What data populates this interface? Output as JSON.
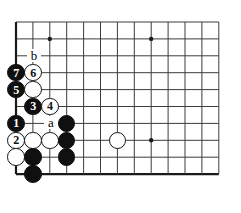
{
  "figure": {
    "name": "go-board-diagram",
    "type": "go-joseki-diagram",
    "corner": "bottom-left",
    "background_color": "#ffffff",
    "line_color": "#3c3c3c",
    "edge_color": "#1a1a1a",
    "black_color": "#101010",
    "white_color": "#ffffff"
  },
  "board": {
    "origin_x": 16,
    "origin_y": 22,
    "spacing": 16.9,
    "cols": 13,
    "rows": 10,
    "left_edge_is_board_edge": true,
    "bottom_edge_is_board_edge": true,
    "star_points": [
      {
        "col": 3,
        "row": 2
      },
      {
        "col": 9,
        "row": 2
      },
      {
        "col": 9,
        "row": 8
      }
    ]
  },
  "stones": [
    {
      "id": "s-w6",
      "color": "white",
      "label": "6",
      "col": 2,
      "row": 4
    },
    {
      "id": "s-b7",
      "color": "black",
      "label": "7",
      "col": 1,
      "row": 4
    },
    {
      "id": "s-b5",
      "color": "black",
      "label": "5",
      "col": 1,
      "row": 5
    },
    {
      "id": "s-w-c2r5",
      "color": "white",
      "label": "",
      "col": 2,
      "row": 5
    },
    {
      "id": "s-b3",
      "color": "black",
      "label": "3",
      "col": 2,
      "row": 6
    },
    {
      "id": "s-w4",
      "color": "white",
      "label": "4",
      "col": 3,
      "row": 6
    },
    {
      "id": "s-b1",
      "color": "black",
      "label": "1",
      "col": 1,
      "row": 7
    },
    {
      "id": "s-b-c4r7",
      "color": "black",
      "label": "",
      "col": 4,
      "row": 7
    },
    {
      "id": "s-w2",
      "color": "white",
      "label": "2",
      "col": 1,
      "row": 8
    },
    {
      "id": "s-w-c2r8",
      "color": "white",
      "label": "",
      "col": 2,
      "row": 8
    },
    {
      "id": "s-w-c3r8",
      "color": "white",
      "label": "",
      "col": 3,
      "row": 8
    },
    {
      "id": "s-b-c4r8",
      "color": "black",
      "label": "",
      "col": 4,
      "row": 8
    },
    {
      "id": "s-w-c7r8",
      "color": "white",
      "label": "",
      "col": 7,
      "row": 8
    },
    {
      "id": "s-w-c1r9",
      "color": "white",
      "label": "",
      "col": 1,
      "row": 9
    },
    {
      "id": "s-b-c2r9",
      "color": "black",
      "label": "",
      "col": 2,
      "row": 9
    },
    {
      "id": "s-b-c4r9",
      "color": "black",
      "label": "",
      "col": 4,
      "row": 9
    },
    {
      "id": "s-b-c2r10",
      "color": "black",
      "label": "",
      "col": 2,
      "row": 10
    }
  ],
  "point_labels": [
    {
      "id": "label-b",
      "text": "b",
      "col": 2,
      "row": 3
    },
    {
      "id": "label-a",
      "text": "a",
      "col": 3,
      "row": 7
    }
  ]
}
